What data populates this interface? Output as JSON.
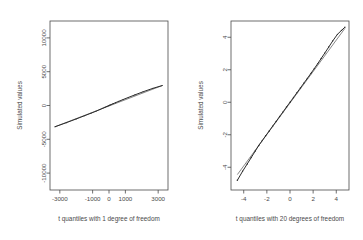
{
  "figure": {
    "background_color": "#ffffff",
    "ink_color": "#4a4a4a",
    "point_color": "#2b2b2b",
    "line_color": "#555555",
    "panel_count": 2
  },
  "chart_data": [
    {
      "type": "scatter",
      "title": "",
      "xlabel": "t quantiles with 1 degree of freedom",
      "ylabel": "Simulated values",
      "xlim": [
        -3600,
        3600
      ],
      "ylim": [
        -12500,
        12500
      ],
      "xticks": [
        -3000,
        -1000,
        0,
        1000,
        3000
      ],
      "xticklabels": [
        "-3000",
        "-1000",
        "0",
        "1000",
        "3000"
      ],
      "yticks": [
        -10000,
        -5000,
        0,
        5000,
        10000
      ],
      "yticklabels": [
        "-10000",
        "-5000",
        "0",
        "5000",
        "10000"
      ],
      "grid": false,
      "legend": null,
      "box": true,
      "reference_line": {
        "x": [
          -3300,
          3250
        ],
        "y": [
          -3150,
          2950
        ]
      },
      "x": [
        -3300,
        -2600,
        -2000,
        -1500,
        -1100,
        -800,
        -560,
        -380,
        -230,
        -110,
        -40,
        0,
        45,
        120,
        240,
        400,
        600,
        860,
        1180,
        1580,
        2080,
        2680,
        3250
      ],
      "y": [
        -3150,
        -2540,
        -1990,
        -1520,
        -1140,
        -850,
        -600,
        -400,
        -240,
        -115,
        -45,
        0,
        50,
        130,
        255,
        420,
        620,
        880,
        1190,
        1570,
        2030,
        2540,
        2950
      ]
    },
    {
      "type": "scatter",
      "title": "",
      "xlabel": "t quantiles with 20 degrees of freedom",
      "ylabel": "Simulated values",
      "xlim": [
        -5.1,
        5.1
      ],
      "ylim": [
        -5.4,
        5.0
      ],
      "xticks": [
        -4,
        -2,
        0,
        2,
        4
      ],
      "xticklabels": [
        "-4",
        "-2",
        "0",
        "2",
        "4"
      ],
      "yticks": [
        -4,
        -2,
        0,
        2,
        4
      ],
      "yticklabels": [
        "-4",
        "-2",
        "0",
        "2",
        "4"
      ],
      "grid": false,
      "legend": null,
      "box": true,
      "reference_line": {
        "x": [
          -4.55,
          4.75
        ],
        "y": [
          -4.45,
          4.55
        ]
      },
      "x": [
        -4.55,
        -4.1,
        -3.7,
        -3.35,
        -3.0,
        -2.7,
        -2.4,
        -2.1,
        -1.8,
        -1.5,
        -1.2,
        -0.9,
        -0.6,
        -0.3,
        0.0,
        0.3,
        0.6,
        0.9,
        1.2,
        1.5,
        1.8,
        2.1,
        2.4,
        2.7,
        3.0,
        3.35,
        3.7,
        4.1,
        4.45,
        4.75
      ],
      "y": [
        -4.8,
        -4.25,
        -3.8,
        -3.4,
        -3.0,
        -2.66,
        -2.36,
        -2.06,
        -1.77,
        -1.47,
        -1.18,
        -0.88,
        -0.59,
        -0.29,
        0.0,
        0.29,
        0.59,
        0.88,
        1.18,
        1.47,
        1.77,
        2.07,
        2.38,
        2.7,
        3.02,
        3.4,
        3.78,
        4.18,
        4.42,
        4.62
      ]
    }
  ]
}
